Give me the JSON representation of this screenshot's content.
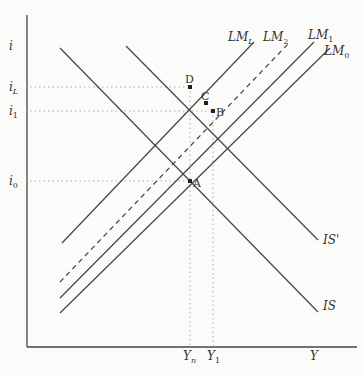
{
  "diagram": {
    "type": "IS-LM diagram",
    "axes": {
      "y_label": "i",
      "x_label": "Y"
    },
    "y_ticks": [
      {
        "label": "i_L",
        "main": "i",
        "sub": "L",
        "y": 87
      },
      {
        "label": "i_1",
        "main": "i",
        "sub": "1",
        "y": 111
      },
      {
        "label": "i_0",
        "main": "i",
        "sub": "0",
        "y": 181
      }
    ],
    "x_ticks": [
      {
        "label": "Y_n",
        "main": "Y",
        "sub": "n",
        "x": 190
      },
      {
        "label": "Y_1",
        "main": "Y",
        "sub": "1",
        "x": 213
      }
    ],
    "curves": [
      {
        "name": "LM_L",
        "main": "LM",
        "sub": "L",
        "style": "solid"
      },
      {
        "name": "LM_2",
        "main": "LM",
        "sub": "2",
        "style": "dashed"
      },
      {
        "name": "LM_1",
        "main": "LM",
        "sub": "1",
        "style": "solid"
      },
      {
        "name": "LM_0",
        "main": "LM",
        "sub": "0",
        "style": "solid"
      },
      {
        "name": "IS'",
        "main": "IS'",
        "style": "solid"
      },
      {
        "name": "IS",
        "main": "IS",
        "style": "solid"
      }
    ],
    "points": [
      {
        "label": "D"
      },
      {
        "label": "C"
      },
      {
        "label": "B"
      },
      {
        "label": "A"
      }
    ]
  }
}
